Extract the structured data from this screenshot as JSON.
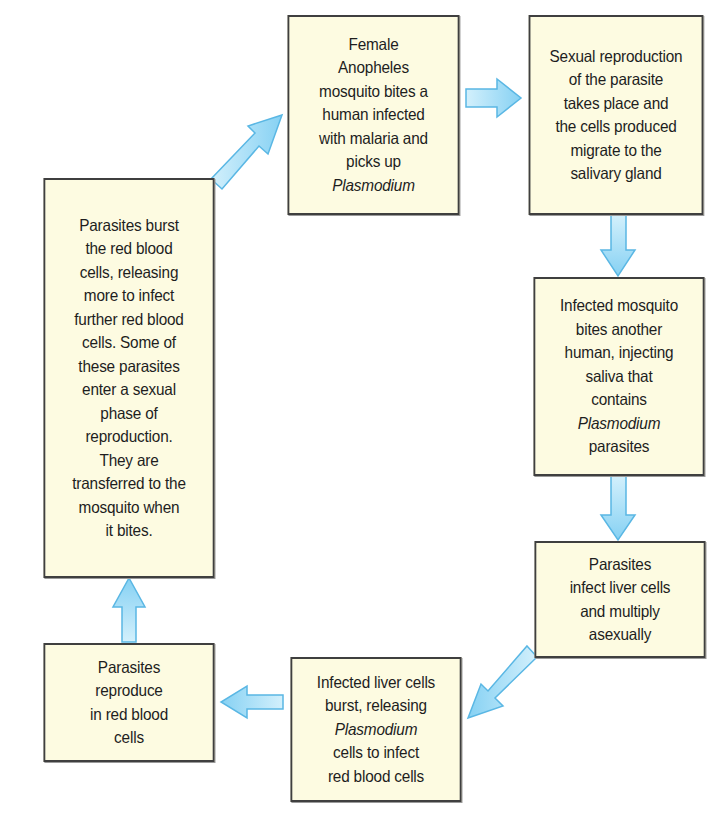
{
  "diagram": {
    "colors": {
      "box_fill": "#fdfbe1",
      "box_border": "#3f3f3f",
      "arrow_fill_light": "#c9ecfb",
      "arrow_fill_dark": "#85d0f2",
      "arrow_stroke": "#5ab7e4",
      "text": "#1e1e1e"
    },
    "nodes": [
      {
        "id": "mosquito-bites-infected-human",
        "lines": [
          {
            "text": "Female",
            "italic": false
          },
          {
            "text": "Anopheles",
            "italic": false
          },
          {
            "text": "mosquito bites a",
            "italic": false
          },
          {
            "text": "human infected",
            "italic": false
          },
          {
            "text": "with malaria and",
            "italic": false
          },
          {
            "text": "picks up",
            "italic": false
          },
          {
            "text": "Plasmodium",
            "italic": true
          }
        ]
      },
      {
        "id": "sexual-reproduction",
        "lines": [
          {
            "text": "Sexual reproduction",
            "italic": false
          },
          {
            "text": "of the parasite",
            "italic": false
          },
          {
            "text": "takes place and",
            "italic": false
          },
          {
            "text": "the cells produced",
            "italic": false
          },
          {
            "text": "migrate to the",
            "italic": false
          },
          {
            "text": "salivary gland",
            "italic": false
          }
        ]
      },
      {
        "id": "mosquito-bites-another-human",
        "lines": [
          {
            "text": "Infected mosquito",
            "italic": false
          },
          {
            "text": "bites another",
            "italic": false
          },
          {
            "text": "human, injecting",
            "italic": false
          },
          {
            "text": "saliva that",
            "italic": false
          },
          {
            "text": "contains",
            "italic": false
          },
          {
            "text": "Plasmodium",
            "italic": true
          },
          {
            "text": "parasites",
            "italic": false
          }
        ]
      },
      {
        "id": "infect-liver-cells",
        "lines": [
          {
            "text": "Parasites",
            "italic": false
          },
          {
            "text": "infect liver cells",
            "italic": false
          },
          {
            "text": "and multiply",
            "italic": false
          },
          {
            "text": "asexually",
            "italic": false
          }
        ]
      },
      {
        "id": "liver-cells-burst",
        "lines": [
          {
            "text": "Infected liver cells",
            "italic": false
          },
          {
            "text": "burst, releasing",
            "italic": false
          },
          {
            "text": "Plasmodium",
            "italic": true
          },
          {
            "text": "cells to infect",
            "italic": false
          },
          {
            "text": "red blood cells",
            "italic": false
          }
        ]
      },
      {
        "id": "reproduce-in-red-blood-cells",
        "lines": [
          {
            "text": "Parasites",
            "italic": false
          },
          {
            "text": "reproduce",
            "italic": false
          },
          {
            "text": "in red blood",
            "italic": false
          },
          {
            "text": "cells",
            "italic": false
          }
        ]
      },
      {
        "id": "burst-red-blood-cells",
        "lines": [
          {
            "text": "Parasites burst",
            "italic": false
          },
          {
            "text": "the red blood",
            "italic": false
          },
          {
            "text": "cells, releasing",
            "italic": false
          },
          {
            "text": "more to infect",
            "italic": false
          },
          {
            "text": "further red blood",
            "italic": false
          },
          {
            "text": "cells. Some of",
            "italic": false
          },
          {
            "text": "these parasites",
            "italic": false
          },
          {
            "text": "enter a sexual",
            "italic": false
          },
          {
            "text": "phase of",
            "italic": false
          },
          {
            "text": "reproduction.",
            "italic": false
          },
          {
            "text": "They are",
            "italic": false
          },
          {
            "text": "transferred to the",
            "italic": false
          },
          {
            "text": "mosquito when",
            "italic": false
          },
          {
            "text": "it bites.",
            "italic": false
          }
        ]
      }
    ],
    "edges": [
      {
        "from": "mosquito-bites-infected-human",
        "to": "sexual-reproduction",
        "direction": "right"
      },
      {
        "from": "sexual-reproduction",
        "to": "mosquito-bites-another-human",
        "direction": "down"
      },
      {
        "from": "mosquito-bites-another-human",
        "to": "infect-liver-cells",
        "direction": "down"
      },
      {
        "from": "infect-liver-cells",
        "to": "liver-cells-burst",
        "direction": "down-left"
      },
      {
        "from": "liver-cells-burst",
        "to": "reproduce-in-red-blood-cells",
        "direction": "left"
      },
      {
        "from": "reproduce-in-red-blood-cells",
        "to": "burst-red-blood-cells",
        "direction": "up"
      },
      {
        "from": "burst-red-blood-cells",
        "to": "mosquito-bites-infected-human",
        "direction": "up-right"
      }
    ]
  }
}
